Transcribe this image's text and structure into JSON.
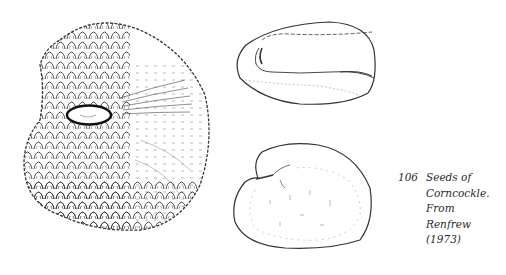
{
  "figure": {
    "number": "106",
    "caption_lines": [
      "Seeds of",
      "Corncockle.",
      "From",
      "Renfrew",
      "(1973)"
    ],
    "illustrations": [
      {
        "name": "large-seed-detailed-view",
        "description": "Tuberculate corncockle seed with hilum"
      },
      {
        "name": "seed-side-view-top",
        "description": "Smooth seed outline, oblique view"
      },
      {
        "name": "seed-side-view-bottom",
        "description": "Kidney-shaped seed outline, lateral view"
      }
    ],
    "ink_color": "#222222"
  }
}
